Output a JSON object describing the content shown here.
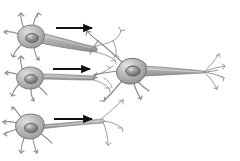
{
  "figure": {
    "caption": "",
    "background_color": "#ffffff",
    "width": 240,
    "height": 161,
    "style": "grayscale shaded line illustration"
  },
  "palette": {
    "background": "#ffffff",
    "soma_fill_light": "#d8d8d8",
    "soma_fill_mid": "#a8a8a8",
    "soma_fill_dark": "#8e8e8e",
    "soma_outline": "#6f6f6f",
    "nucleus_fill": "#8a8a8a",
    "nucleus_outline": "#5e5e5e",
    "nucleus_highlight": "#c9c9c9",
    "axon_fill": "#b4b4b4",
    "axon_outline": "#7a7a7a",
    "dendrite_stroke": "#8b8b8b",
    "terminal_stroke": "#9a9a9a",
    "arrow_color": "#111111"
  },
  "elements": {
    "presynaptic_neurons": [
      {
        "id": "presynaptic-neuron-top",
        "label": "",
        "soma_center": [
          31,
          37
        ],
        "soma_radius": [
          13,
          11
        ],
        "nucleus_center": [
          32,
          38
        ],
        "dendrite_count": 5,
        "axon_direction": "right",
        "axon_end": [
          97,
          50
        ],
        "terminal_branches": 3
      },
      {
        "id": "presynaptic-neuron-middle",
        "label": "",
        "soma_center": [
          30,
          79
        ],
        "soma_radius": [
          13,
          11
        ],
        "nucleus_center": [
          31,
          80
        ],
        "dendrite_count": 5,
        "axon_direction": "right",
        "axon_end": [
          95,
          78
        ],
        "terminal_branches": 3
      },
      {
        "id": "presynaptic-neuron-bottom",
        "label": "",
        "soma_center": [
          30,
          127
        ],
        "soma_radius": [
          14,
          12
        ],
        "nucleus_center": [
          31,
          128
        ],
        "dendrite_count": 6,
        "axon_direction": "right",
        "axon_end": [
          103,
          121
        ],
        "terminal_branches": 3
      }
    ],
    "postsynaptic_neuron": {
      "id": "postsynaptic-neuron-central",
      "label": "",
      "soma_center": [
        131,
        71
      ],
      "soma_radius": [
        17,
        13
      ],
      "nucleus_center": [
        133,
        71
      ],
      "dendrite_count": 4,
      "axon_direction": "right",
      "axon_end": [
        205,
        72
      ],
      "terminal_branches": 5
    },
    "arrows": [
      {
        "id": "signal-arrow-top",
        "label": "",
        "from": [
          56,
          28
        ],
        "to": [
          95,
          28
        ],
        "direction": "right"
      },
      {
        "id": "signal-arrow-middle",
        "label": "",
        "from": [
          53,
          69
        ],
        "to": [
          93,
          69
        ],
        "direction": "right"
      },
      {
        "id": "signal-arrow-bottom",
        "label": "",
        "from": [
          54,
          119
        ],
        "to": [
          95,
          119
        ],
        "direction": "right"
      }
    ]
  },
  "icons": {
    "arrow": "arrow-right-icon",
    "neuron": "neuron-icon",
    "nucleus": "nucleus-icon"
  }
}
